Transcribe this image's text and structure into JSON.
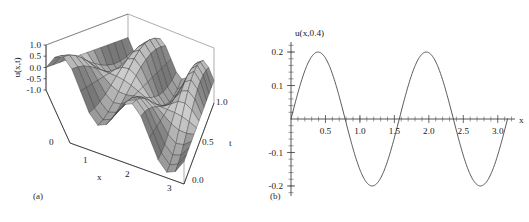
{
  "figure": {
    "background": "#ffffff",
    "panels": [
      {
        "caption": "(a)",
        "type": "surface3d",
        "title": "",
        "zlabel": "u(x,t)",
        "xlabel": "x",
        "ylabel": "t",
        "z_ticks": [
          "1.0",
          "0.5",
          "0.0",
          "-0.5",
          "-1.0"
        ],
        "x_ticks": [
          "0",
          "1",
          "2",
          "3"
        ],
        "y_ticks": [
          "0.0",
          "0.5",
          "1.0"
        ],
        "xlim": [
          0,
          3.141592653589793
        ],
        "ylim": [
          0,
          1
        ],
        "zlim": [
          -1,
          1
        ],
        "surface_color": "#bdbdbd",
        "mesh_color": "#2f2f2f",
        "box_color": "#767676"
      },
      {
        "caption": "(b)",
        "type": "line",
        "ylabel": "u(x,0.4)",
        "xlabel": "x",
        "x_ticks": [
          "0.5",
          "1.0",
          "1.5",
          "2.0",
          "2.5",
          "3.0"
        ],
        "y_ticks": [
          "0.2",
          "0.1",
          "-0.1",
          "-0.2"
        ],
        "curve_color": "#3c3c3c",
        "axis_color": "#2b2b2b"
      }
    ]
  },
  "chart_data": [
    {
      "type": "heatmap",
      "subtype": "surface-mesh-3d",
      "title": "",
      "xlabel": "x",
      "ylabel": "t",
      "zlabel": "u(x,t)",
      "xlim": [
        0,
        3.141592653589793
      ],
      "ylim": [
        0,
        1
      ],
      "zlim": [
        -1,
        1
      ],
      "xticks": [
        0,
        1,
        2,
        3
      ],
      "yticks": [
        0,
        0.5,
        1
      ],
      "zticks": [
        -1,
        -0.5,
        0,
        0.5,
        1
      ],
      "xticklabels": [
        "0",
        "1",
        "2",
        "3"
      ],
      "yticklabels": [
        "0.0",
        "0.5",
        "1.0"
      ],
      "zticklabels": [
        "-1.0",
        "-0.5",
        "0.0",
        "0.5",
        "1.0"
      ],
      "grid": false,
      "legend": "none",
      "function": "u(x,t) = sin(4x) * cos(4t)",
      "description": "Damped standing-wave surface: two spatial lobes along x decaying in amplitude as t increases; large negative troughs near x=1 and x=2.4 at t=0.",
      "mesh_nx": 17,
      "mesh_nt": 13,
      "annotations": []
    },
    {
      "type": "line",
      "title": "",
      "xlabel": "x",
      "ylabel": "u(x,0.4)",
      "xlim": [
        0,
        3.25
      ],
      "ylim": [
        -0.23,
        0.23
      ],
      "xticks": [
        0.5,
        1.0,
        1.5,
        2.0,
        2.5,
        3.0
      ],
      "yticks": [
        0.2,
        0.1,
        -0.1,
        -0.2
      ],
      "xticklabels": [
        "0.5",
        "1.0",
        "1.5",
        "2.0",
        "2.5",
        "3.0"
      ],
      "yticklabels": [
        "0.2",
        "0.1",
        "-0.1",
        "-0.2"
      ],
      "minor_tick_dx": 0.1,
      "minor_tick_dy": 0.02,
      "grid": false,
      "legend": "none",
      "function": "u(x,0.4) = 0.2 * sin(4x)",
      "amplitude": 0.2,
      "period": 1.5707963267948966,
      "zero_crossings": [
        0.0,
        0.7854,
        1.5708,
        2.3562,
        3.1416
      ],
      "maxima": [
        {
          "x": 0.3927,
          "y": 0.2
        },
        {
          "x": 1.9635,
          "y": 0.2
        }
      ],
      "minima": [
        {
          "x": 1.1781,
          "y": -0.2
        },
        {
          "x": 2.7489,
          "y": -0.2
        }
      ],
      "series": [
        {
          "name": "u(x,0.4)",
          "x": [
            0.0,
            0.1,
            0.2,
            0.3,
            0.3927,
            0.5,
            0.6,
            0.7,
            0.7854,
            0.9,
            1.0,
            1.1,
            1.1781,
            1.3,
            1.4,
            1.5,
            1.5708,
            1.7,
            1.8,
            1.9,
            1.9635,
            2.1,
            2.2,
            2.3,
            2.3562,
            2.5,
            2.6,
            2.7,
            2.7489,
            2.9,
            3.0,
            3.1,
            3.1416
          ],
          "y": [
            0.0,
            0.0779,
            0.1436,
            0.1866,
            0.2,
            0.1819,
            0.1352,
            0.0696,
            0.0,
            -0.1186,
            -0.1514,
            -0.187,
            -0.2,
            -0.1798,
            -0.1277,
            -0.0558,
            0.0,
            0.0998,
            0.1587,
            0.194,
            0.2,
            0.1632,
            0.1089,
            0.0395,
            0.0,
            -0.0841,
            -0.1414,
            -0.1818,
            -0.2,
            -0.186,
            -0.1397,
            -0.0756,
            0.0
          ]
        }
      ],
      "annotations": []
    }
  ]
}
